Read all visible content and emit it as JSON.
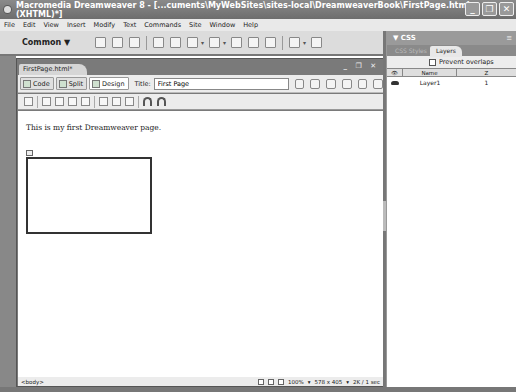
{
  "window": {
    "title": "Macromedia Dreamweaver 8 - [...cuments\\MyWebSites\\sites-local\\DreamweaverBook\\FirstPage.html (XHTML)*]",
    "controls": [
      "_",
      "❐",
      "✕"
    ]
  },
  "menubar": {
    "items": [
      "File",
      "Edit",
      "View",
      "Insert",
      "Modify",
      "Text",
      "Commands",
      "Site",
      "Window",
      "Help"
    ]
  },
  "insertbar": {
    "category": "Common ▼",
    "icons": [
      "hyperlink-icon",
      "email-link-icon",
      "named-anchor-icon",
      "table-icon",
      "div-icon",
      "layer-icon",
      "image-icon",
      "media-icon",
      "date-icon",
      "server-side-include-icon",
      "comment-icon",
      "templates-icon",
      "tag-chooser-icon"
    ]
  },
  "document": {
    "tab_label": "FirstPage.html*",
    "window_controls": "_ ❐ ✕",
    "view_buttons": {
      "code": "Code",
      "split": "Split",
      "design": "Design"
    },
    "title_label": "Title:",
    "title_value": "First Page",
    "body_text": "This is my first Dreamweaver page.",
    "status": {
      "tag": "<body>",
      "zoom": "100%",
      "size": "578 x 405",
      "download": "2K / 1 sec"
    }
  },
  "panel": {
    "group_title": "▼ CSS",
    "tabs": [
      {
        "label": "CSS Styles",
        "active": false
      },
      {
        "label": "Layers",
        "active": true
      }
    ],
    "prevent_overlaps_label": "Prevent overlaps",
    "prevent_overlaps_checked": false,
    "columns": [
      "👁",
      "Name",
      "Z"
    ],
    "layers": [
      {
        "visible_icon": "eye",
        "name": "Layer1",
        "z": "1"
      }
    ]
  }
}
